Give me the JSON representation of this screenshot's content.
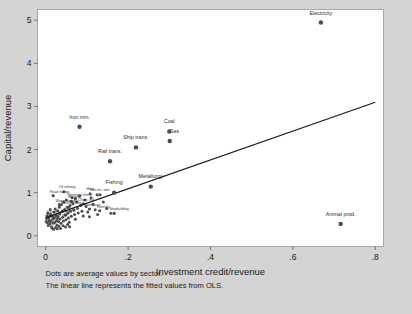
{
  "chart_data": {
    "type": "scatter",
    "title": "",
    "xlabel": "Investment credit/revenue",
    "ylabel": "Capital/revenue",
    "xlim": [
      -0.02,
      0.82
    ],
    "ylim": [
      -0.25,
      5.25
    ],
    "xticks": [
      "0",
      ".2",
      ".4",
      ".6",
      ".8"
    ],
    "xtick_values": [
      0,
      0.2,
      0.4,
      0.6,
      0.8
    ],
    "yticks": [
      "0",
      "1",
      "2",
      "3",
      "4",
      "5"
    ],
    "ytick_values": [
      0,
      1,
      2,
      3,
      4,
      5
    ],
    "grid": false,
    "legend": "none",
    "marker_color": "#4d4d4d",
    "line_color": "#1a1a1a",
    "plot_bg": "#ffffff",
    "figure_bg": "#d4d4d4",
    "points": [
      {
        "label": "Electricity",
        "x": 0.668,
        "y": 4.95,
        "lx": 0.668,
        "ly": 5.12,
        "anchor": "middle",
        "size": "lg"
      },
      {
        "label": "Iron min.",
        "x": 0.082,
        "y": 2.53,
        "lx": 0.082,
        "ly": 2.72,
        "anchor": "middle",
        "size": "lg"
      },
      {
        "label": "Coal",
        "x": 0.3,
        "y": 2.42,
        "lx": 0.3,
        "ly": 2.61,
        "anchor": "middle",
        "size": "lg"
      },
      {
        "label": "Gas",
        "x": 0.301,
        "y": 2.2,
        "lx": 0.312,
        "ly": 2.38,
        "anchor": "middle",
        "size": "lg"
      },
      {
        "label": "Ship trans.",
        "x": 0.219,
        "y": 2.05,
        "lx": 0.219,
        "ly": 2.24,
        "anchor": "middle",
        "size": "lg"
      },
      {
        "label": "Rail trans.",
        "x": 0.156,
        "y": 1.73,
        "lx": 0.156,
        "ly": 1.92,
        "anchor": "middle",
        "size": "lg"
      },
      {
        "label": "Metallurgy",
        "x": 0.255,
        "y": 1.14,
        "lx": 0.255,
        "ly": 1.33,
        "anchor": "middle",
        "size": "lg"
      },
      {
        "label": "Fishing",
        "x": 0.166,
        "y": 1.0,
        "lx": 0.166,
        "ly": 1.19,
        "anchor": "middle",
        "size": "lg"
      },
      {
        "label": "Animal prod.",
        "x": 0.716,
        "y": 0.275,
        "lx": 0.716,
        "ly": 0.46,
        "anchor": "middle",
        "size": "lg"
      }
    ],
    "cluster_points": [
      {
        "label": "Oil refining",
        "x": 0.044,
        "y": 1.02,
        "lx": 0.052,
        "ly": 1.1,
        "anchor": "middle"
      },
      {
        "label": "Heat",
        "x": 0.108,
        "y": 0.97,
        "lx": 0.108,
        "ly": 1.06,
        "anchor": "middle"
      },
      {
        "label": "Non-fer. met.",
        "x": 0.125,
        "y": 0.95,
        "lx": 0.132,
        "ly": 1.03,
        "anchor": "middle"
      },
      {
        "label": "Road transp.",
        "x": 0.018,
        "y": 0.93,
        "lx": 0.01,
        "ly": 1.0,
        "anchor": "start"
      },
      {
        "label": "Nonmetal min.",
        "x": 0.072,
        "y": 0.86,
        "lx": 0.08,
        "ly": 0.93,
        "anchor": "middle"
      },
      {
        "label": "Housing",
        "x": 0.062,
        "y": 0.8,
        "lx": 0.07,
        "ly": 0.87,
        "anchor": "middle"
      },
      {
        "label": "Water transp.",
        "x": 0.033,
        "y": 0.72,
        "lx": 0.024,
        "ly": 0.79,
        "anchor": "start"
      },
      {
        "label": "Chem. ind.",
        "x": 0.091,
        "y": 0.74,
        "lx": 0.099,
        "ly": 0.81,
        "anchor": "middle"
      },
      {
        "label": "Machine bldg.",
        "x": 0.056,
        "y": 0.66,
        "lx": 0.062,
        "ly": 0.73,
        "anchor": "middle"
      },
      {
        "label": "Wood proc.",
        "x": 0.106,
        "y": 0.62,
        "lx": 0.114,
        "ly": 0.69,
        "anchor": "middle"
      },
      {
        "label": "Forestry",
        "x": 0.131,
        "y": 0.58,
        "lx": 0.14,
        "ly": 0.65,
        "anchor": "middle"
      },
      {
        "label": "Shipbuilding",
        "x": 0.166,
        "y": 0.52,
        "lx": 0.178,
        "ly": 0.6,
        "anchor": "middle"
      },
      {
        "label": "Infrastructure",
        "x": 0.01,
        "y": 0.46,
        "lx": 0.002,
        "ly": 0.52,
        "anchor": "start"
      },
      {
        "label": "Textile",
        "x": 0.008,
        "y": 0.34,
        "lx": 0.0,
        "ly": 0.4,
        "anchor": "start"
      },
      {
        "label": "Food ind.",
        "x": 0.048,
        "y": 0.48,
        "lx": 0.056,
        "ly": 0.55,
        "anchor": "middle"
      },
      {
        "label": "Light ind.",
        "x": 0.028,
        "y": 0.4,
        "lx": 0.036,
        "ly": 0.46,
        "anchor": "middle"
      }
    ],
    "scatter_cloud": [
      [
        0.004,
        0.3
      ],
      [
        0.006,
        0.24
      ],
      [
        0.007,
        0.42
      ],
      [
        0.009,
        0.36
      ],
      [
        0.01,
        0.27
      ],
      [
        0.012,
        0.5
      ],
      [
        0.013,
        0.33
      ],
      [
        0.014,
        0.21
      ],
      [
        0.016,
        0.45
      ],
      [
        0.017,
        0.38
      ],
      [
        0.018,
        0.29
      ],
      [
        0.02,
        0.55
      ],
      [
        0.021,
        0.41
      ],
      [
        0.022,
        0.31
      ],
      [
        0.023,
        0.62
      ],
      [
        0.025,
        0.47
      ],
      [
        0.026,
        0.35
      ],
      [
        0.027,
        0.25
      ],
      [
        0.029,
        0.58
      ],
      [
        0.03,
        0.44
      ],
      [
        0.031,
        0.33
      ],
      [
        0.033,
        0.66
      ],
      [
        0.034,
        0.51
      ],
      [
        0.035,
        0.39
      ],
      [
        0.037,
        0.29
      ],
      [
        0.038,
        0.72
      ],
      [
        0.04,
        0.56
      ],
      [
        0.041,
        0.43
      ],
      [
        0.043,
        0.34
      ],
      [
        0.044,
        0.78
      ],
      [
        0.046,
        0.61
      ],
      [
        0.047,
        0.48
      ],
      [
        0.049,
        0.37
      ],
      [
        0.05,
        0.83
      ],
      [
        0.052,
        0.66
      ],
      [
        0.054,
        0.52
      ],
      [
        0.055,
        0.41
      ],
      [
        0.057,
        0.31
      ],
      [
        0.059,
        0.7
      ],
      [
        0.06,
        0.57
      ],
      [
        0.062,
        0.45
      ],
      [
        0.064,
        0.88
      ],
      [
        0.066,
        0.74
      ],
      [
        0.068,
        0.6
      ],
      [
        0.07,
        0.49
      ],
      [
        0.072,
        0.38
      ],
      [
        0.075,
        0.79
      ],
      [
        0.077,
        0.64
      ],
      [
        0.079,
        0.53
      ],
      [
        0.082,
        0.92
      ],
      [
        0.085,
        0.7
      ],
      [
        0.088,
        0.57
      ],
      [
        0.091,
        0.46
      ],
      [
        0.095,
        0.83
      ],
      [
        0.098,
        0.68
      ],
      [
        0.102,
        0.55
      ],
      [
        0.106,
        0.44
      ],
      [
        0.11,
        0.88
      ],
      [
        0.115,
        0.73
      ],
      [
        0.12,
        0.6
      ],
      [
        0.126,
        0.49
      ],
      [
        0.132,
        0.95
      ],
      [
        0.14,
        0.78
      ],
      [
        0.148,
        0.63
      ],
      [
        0.158,
        0.52
      ],
      [
        0.015,
        0.18
      ],
      [
        0.019,
        0.15
      ],
      [
        0.024,
        0.19
      ],
      [
        0.028,
        0.16
      ],
      [
        0.032,
        0.22
      ],
      [
        0.036,
        0.17
      ],
      [
        0.042,
        0.23
      ],
      [
        0.048,
        0.2
      ],
      [
        0.053,
        0.26
      ],
      [
        0.058,
        0.21
      ],
      [
        0.005,
        0.52
      ],
      [
        0.011,
        0.61
      ],
      [
        0.002,
        0.4
      ],
      [
        0.003,
        0.46
      ],
      [
        0.001,
        0.33
      ]
    ],
    "fit_line": {
      "x0": 0.0,
      "y0": 0.42,
      "x1": 0.8,
      "y1": 3.1
    }
  },
  "notes": {
    "line1": "Dots are average values by sector.",
    "line2": "The linear line represents the fitted values from OLS."
  }
}
